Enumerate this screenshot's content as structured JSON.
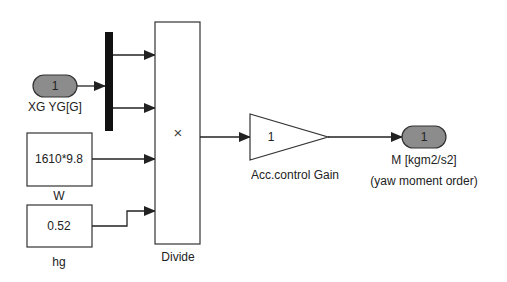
{
  "diagram": {
    "type": "simulink-block-diagram",
    "colors": {
      "line": "#222222",
      "port_fill": "#8c8c8c",
      "block_fill": "#ffffff"
    },
    "blocks": {
      "inport": {
        "number": "1",
        "label": "XG YG[G]"
      },
      "demux": {
        "label": ""
      },
      "const_w": {
        "value": "1610*9.8",
        "label": "W"
      },
      "const_hg": {
        "value": "0.52",
        "label": "hg"
      },
      "divide": {
        "symbol": "×",
        "label": "Divide"
      },
      "gain": {
        "value": "1",
        "label": "Acc.control Gain"
      },
      "outport": {
        "number": "1",
        "label_line1": "M [kgm2/s2]",
        "label_line2": "(yaw moment order)"
      }
    },
    "connections": [
      {
        "from": "inport",
        "to": "demux"
      },
      {
        "from": "demux.out1",
        "to": "divide.in1"
      },
      {
        "from": "demux.out2",
        "to": "divide.in2"
      },
      {
        "from": "const_w",
        "to": "divide.in3"
      },
      {
        "from": "const_hg",
        "to": "divide.in4"
      },
      {
        "from": "divide",
        "to": "gain"
      },
      {
        "from": "gain",
        "to": "outport"
      }
    ]
  }
}
